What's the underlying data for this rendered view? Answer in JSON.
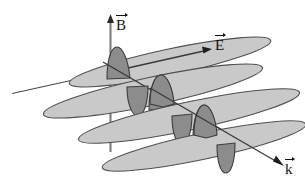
{
  "figure": {
    "kind": "electromagnetic-wave-diagram",
    "background_color": "#ffffff",
    "line_color": "#3b3b3b",
    "stroke_color": "#4a4a4a",
    "plane_fill": "#c9c9c9",
    "lobe_fill": "#8c8c8c",
    "axis_color": "#6e6e6e",
    "width": 305,
    "height": 188
  },
  "axes": [
    {
      "id": "B",
      "name": "magnetic-field-axis",
      "label": "B",
      "direction": "vertical-up",
      "arrow_head": "up",
      "from": [
        110,
        150
      ],
      "to": [
        110,
        17
      ]
    },
    {
      "id": "E",
      "name": "electric-field-axis",
      "label": "E",
      "direction": "up-right",
      "arrow_head": "up-right",
      "from": [
        12,
        93
      ],
      "to": [
        210,
        50
      ]
    },
    {
      "id": "k",
      "name": "propagation-vector-axis",
      "label": "k",
      "direction": "down-right",
      "arrow_head": "down-right",
      "from": [
        103,
        62
      ],
      "to": [
        283,
        166
      ]
    }
  ],
  "labels": {
    "B": "B",
    "E": "E",
    "k": "k"
  },
  "planes": [
    {
      "name": "field-plane-1",
      "center": [
        170,
        62
      ],
      "half_length": 103,
      "half_height": 13,
      "tilt_deg": -12
    },
    {
      "name": "field-plane-2",
      "center": [
        153,
        91
      ],
      "half_length": 112,
      "half_height": 14,
      "tilt_deg": -12
    },
    {
      "name": "field-plane-3",
      "center": [
        189,
        116
      ],
      "half_length": 113,
      "half_height": 14,
      "tilt_deg": -12
    },
    {
      "name": "field-plane-4",
      "center": [
        204,
        146
      ],
      "half_length": 104,
      "half_height": 13,
      "tilt_deg": -12
    }
  ],
  "wave": {
    "name": "sinusoidal-field-wave",
    "description": "transverse sine oscillation along propagation direction k",
    "lobe_count": 6,
    "lobes": [
      {
        "name": "wave-lobe-1",
        "apex": [
          117,
          56
        ],
        "base_center": [
          119,
          80
        ],
        "half_width": 11,
        "side": "up"
      },
      {
        "name": "wave-lobe-2",
        "apex": [
          138,
          113
        ],
        "base_center": [
          136,
          88
        ],
        "half_width": 10,
        "side": "down"
      },
      {
        "name": "wave-lobe-3",
        "apex": [
          160,
          85
        ],
        "base_center": [
          162,
          110
        ],
        "half_width": 11,
        "side": "up"
      },
      {
        "name": "wave-lobe-4",
        "apex": [
          182,
          141
        ],
        "base_center": [
          180,
          117
        ],
        "half_width": 10,
        "side": "down"
      },
      {
        "name": "wave-lobe-5",
        "apex": [
          203,
          114
        ],
        "base_center": [
          205,
          139
        ],
        "half_width": 11,
        "side": "up"
      },
      {
        "name": "wave-lobe-6",
        "apex": [
          226,
          170
        ],
        "base_center": [
          224,
          146
        ],
        "half_width": 10,
        "side": "down"
      }
    ]
  }
}
